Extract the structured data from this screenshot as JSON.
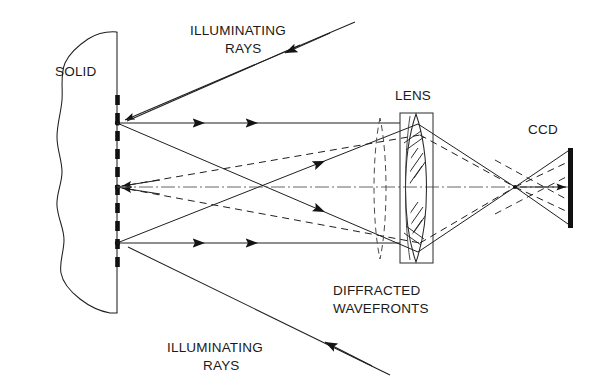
{
  "figure": {
    "background_color": "#ffffff",
    "ink_color": "#1a1a1a",
    "width": 594,
    "height": 388
  },
  "labels": {
    "solid": "SOLID",
    "illuminating_rays_top_line1": "ILLUMINATING",
    "illuminating_rays_top_line2": "RAYS",
    "illuminating_rays_bottom_line1": "ILLUMINATING",
    "illuminating_rays_bottom_line2": "RAYS",
    "lens": "LENS",
    "ccd": "CCD",
    "diffracted_wavefronts_line1": "DIFFRACTED",
    "diffracted_wavefronts_line2": "WAVEFRONTS"
  },
  "components": {
    "solid_block": {
      "name": "SOLID",
      "edge_style": "irregular-freehand-outline",
      "surface_style": "thick-dashed-vertical-line",
      "surface_x": 117
    },
    "source_points": [
      {
        "id": "upper",
        "x": 117,
        "y": 123
      },
      {
        "id": "center",
        "x": 117,
        "y": 187
      },
      {
        "id": "lower",
        "x": 117,
        "y": 243
      }
    ],
    "lens": {
      "type": "doublet",
      "mount_rect": {
        "x": 400,
        "y": 113,
        "w": 33,
        "h": 150
      },
      "elements": 2,
      "hatching": true
    },
    "ccd": {
      "type": "detector-bar",
      "x": 570,
      "y_top": 148,
      "y_bottom": 228,
      "thickness": 5,
      "color": "#111111"
    },
    "crossing_point": {
      "x": 267,
      "y": 187
    },
    "focus_point": {
      "x": 515,
      "y": 187
    },
    "optical_axis_y": 187
  },
  "rays": {
    "solid_arrow_count_upper_horizontal": 2,
    "solid_arrow_count_lower_horizontal": 2,
    "dashed_wavefront_rays": 4,
    "illumination_arrow_top": "down-left",
    "illumination_arrow_bottom": "up-left"
  }
}
